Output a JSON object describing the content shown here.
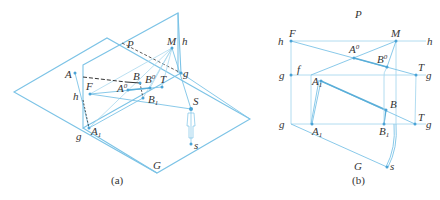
{
  "colors": {
    "line": "#7cc3e6",
    "line_dark": "#5aaed8",
    "point": "#4aa3d6",
    "dash": "#333333",
    "text": "#333333"
  },
  "figure_a": {
    "caption": "(a)",
    "planes": {
      "ground": "G",
      "picture": "P"
    },
    "labels": {
      "P": "P",
      "M": "M",
      "h": "h",
      "g": "g",
      "A": "A",
      "F": "F",
      "A0": "A",
      "A0_sup": "0",
      "B": "B",
      "B0": "B",
      "B0_sup": "0",
      "T": "T",
      "h_left": "h",
      "B1": "B",
      "B1_sub": "1",
      "S": "S",
      "A1": "A",
      "A1_sub": "1",
      "g_left": "g",
      "s": "s",
      "G": "G"
    }
  },
  "figure_b": {
    "caption": "(b)",
    "labels": {
      "P": "P",
      "h_left": "h",
      "F": "F",
      "M": "M",
      "h_right": "h",
      "A0": "A",
      "A0_sup": "0",
      "B0": "B",
      "B0_sup": "0",
      "g_upper_left": "g",
      "f": "f",
      "T_upper": "T",
      "g_upper_right": "g",
      "A1_upper": "A",
      "A1_upper_sub": "1",
      "B": "B",
      "g_lower_left": "g",
      "A1": "A",
      "A1_sub": "1",
      "B1": "B",
      "B1_sub": "1",
      "T_lower": "T",
      "g_lower_right": "g",
      "G": "G",
      "s": "s"
    }
  }
}
